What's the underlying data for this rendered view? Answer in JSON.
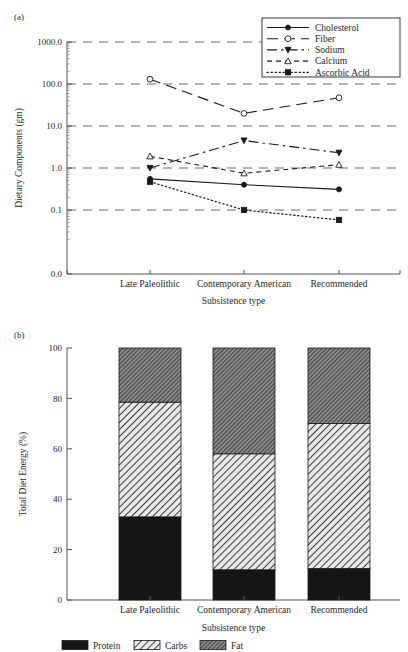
{
  "figure": {
    "panel_a_tag": "(a)",
    "panel_b_tag": "(b)"
  },
  "chart_data": [
    {
      "type": "line",
      "panel": "(a)",
      "title": "",
      "xlabel": "Subsistence type",
      "ylabel": "Dietary Components (gm)",
      "categories": [
        "Late Paleolithic",
        "Contemporary American",
        "Recommended"
      ],
      "yscale": "log",
      "ytick_labels": [
        "1000.0",
        "100.0",
        "10.0",
        "1.0",
        "0.1",
        "0.0"
      ],
      "ytick_values": [
        1000.0,
        100.0,
        10.0,
        1.0,
        0.1,
        0.0
      ],
      "ylim": [
        0.1,
        1000.0
      ],
      "grid": "horizontal-dashed",
      "legend_position": "top-right",
      "series": [
        {
          "name": "Cholesterol",
          "values": [
            0.55,
            0.4,
            0.31
          ],
          "marker": "filled-circle",
          "linestyle": "solid",
          "color": "#1a1a1a"
        },
        {
          "name": "Fiber",
          "values": [
            130.0,
            20.0,
            47.0
          ],
          "marker": "open-circle",
          "linestyle": "long-dash",
          "color": "#1a1a1a"
        },
        {
          "name": "Sodium",
          "values": [
            1.0,
            4.5,
            2.3
          ],
          "marker": "filled-triangle-down",
          "linestyle": "dash-dot",
          "color": "#1a1a1a"
        },
        {
          "name": "Calcium",
          "values": [
            1.9,
            0.75,
            1.2
          ],
          "marker": "open-triangle-up",
          "linestyle": "short-dash",
          "color": "#1a1a1a"
        },
        {
          "name": "Ascorbic Acid",
          "values": [
            0.47,
            0.1,
            0.058
          ],
          "marker": "filled-square",
          "linestyle": "dotted",
          "color": "#1a1a1a"
        }
      ]
    },
    {
      "type": "bar",
      "panel": "(b)",
      "stacked": true,
      "title": "",
      "xlabel": "Subsistence type",
      "ylabel": "Total Diet Energy (%)",
      "categories": [
        "Late Paleolithic",
        "Contemporary American",
        "Recommended"
      ],
      "ytick_labels": [
        "0",
        "20",
        "40",
        "60",
        "80",
        "100"
      ],
      "ytick_values": [
        0,
        20,
        40,
        60,
        80,
        100
      ],
      "ylim": [
        0,
        100
      ],
      "grid": "none",
      "legend_position": "bottom",
      "series": [
        {
          "name": "Protein",
          "values": [
            33,
            12,
            12.5
          ],
          "fill": "solid-black",
          "color": "#1a1a1a"
        },
        {
          "name": "Carbs",
          "values": [
            45.5,
            46,
            57.5
          ],
          "fill": "light-diagonal-hatch",
          "color": "#d0d0d0"
        },
        {
          "name": "Fat",
          "values": [
            21.5,
            42,
            30
          ],
          "fill": "dark-diagonal-hatch",
          "color": "#6e6e6e"
        }
      ]
    }
  ]
}
